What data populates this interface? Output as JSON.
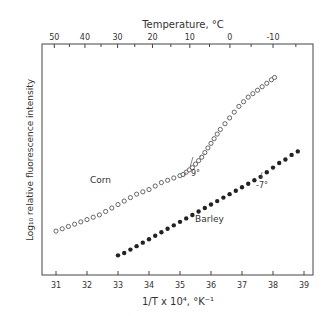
{
  "chart_data": {
    "type": "scatter",
    "title": "",
    "top_axis": {
      "label": "Temperature, °C",
      "ticks": [
        50,
        40,
        30,
        20,
        10,
        0,
        -10
      ]
    },
    "xlabel": "1/T x 10⁴, °K⁻¹",
    "ylabel": "Log₁₀ relative fluorescence intensity",
    "xlim": [
      30.6,
      39.3
    ],
    "ylim": [
      0,
      10
    ],
    "x_ticks": [
      31,
      32,
      33,
      34,
      35,
      36,
      37,
      38,
      39
    ],
    "y_ticks": [],
    "grid": false,
    "legend": "none (inline labels)",
    "series": [
      {
        "name": "Corn",
        "marker": "open-circle",
        "x": [
          31.0,
          31.2,
          31.4,
          31.6,
          31.8,
          32.0,
          32.2,
          32.4,
          32.6,
          32.8,
          33.0,
          33.2,
          33.4,
          33.6,
          33.8,
          34.0,
          34.2,
          34.4,
          34.6,
          34.8,
          35.0,
          35.1,
          35.2,
          35.3,
          35.4,
          35.5,
          35.6,
          35.7,
          35.8,
          35.9,
          36.0,
          36.1,
          36.2,
          36.3,
          36.45,
          36.6,
          36.75,
          36.9,
          37.05,
          37.2,
          37.35,
          37.5,
          37.65,
          37.8,
          37.95,
          38.05
        ],
        "y": [
          1.9,
          2.0,
          2.1,
          2.2,
          2.3,
          2.4,
          2.5,
          2.6,
          2.75,
          2.9,
          3.05,
          3.2,
          3.35,
          3.5,
          3.6,
          3.7,
          3.85,
          4.0,
          4.1,
          4.2,
          4.3,
          4.35,
          4.45,
          4.55,
          4.65,
          4.8,
          4.95,
          5.1,
          5.3,
          5.5,
          5.7,
          5.9,
          6.1,
          6.3,
          6.55,
          6.8,
          7.05,
          7.3,
          7.5,
          7.7,
          7.85,
          8.0,
          8.15,
          8.3,
          8.45,
          8.55
        ],
        "annotation": {
          "text": "9°",
          "x": 35.6
        }
      },
      {
        "name": "Barley",
        "marker": "filled-circle",
        "x": [
          33.0,
          33.2,
          33.4,
          33.6,
          33.8,
          34.0,
          34.2,
          34.4,
          34.6,
          34.8,
          35.0,
          35.2,
          35.4,
          35.6,
          35.8,
          36.0,
          36.2,
          36.4,
          36.6,
          36.8,
          37.0,
          37.2,
          37.4,
          37.6,
          37.8,
          38.0,
          38.2,
          38.4,
          38.6,
          38.8
        ],
        "y": [
          0.85,
          0.95,
          1.1,
          1.25,
          1.4,
          1.55,
          1.7,
          1.85,
          2.0,
          2.15,
          2.3,
          2.45,
          2.6,
          2.75,
          2.9,
          3.05,
          3.2,
          3.35,
          3.5,
          3.65,
          3.8,
          3.95,
          4.1,
          4.25,
          4.45,
          4.65,
          4.85,
          5.0,
          5.2,
          5.35
        ],
        "annotation": {
          "text": "-7°",
          "x": 37.7
        }
      }
    ],
    "labels": {
      "corn": "Corn",
      "barley": "Barley",
      "corn_break": "9°",
      "barley_break": "-7°"
    }
  }
}
